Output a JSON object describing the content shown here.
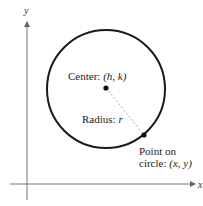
{
  "diagram": {
    "type": "circle-standard-form",
    "axes": {
      "x_label": "x",
      "y_label": "y"
    },
    "center_label": {
      "prefix": "Center: ",
      "value": "(h, k)"
    },
    "radius_label": {
      "prefix": "Radius: ",
      "value": "r"
    },
    "point_label": {
      "line1": "Point on",
      "line2_prefix": "circle: ",
      "line2_value": "(x, y)"
    },
    "colors": {
      "circle": "#1a1a1a",
      "axis": "#777777",
      "radius_line": "#aaaaaa"
    }
  }
}
